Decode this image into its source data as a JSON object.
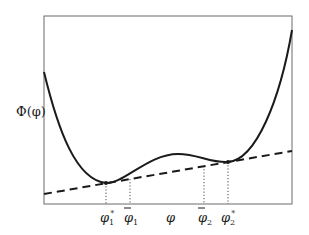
{
  "diagram": {
    "title": "",
    "y_axis_label": "Φ(φ)",
    "x_axis_label": "φ",
    "x_markers": [
      {
        "id": "phi1_star",
        "base": "φ",
        "sub": "1",
        "sup": "*",
        "bar": false
      },
      {
        "id": "phi1_bar",
        "base": "φ",
        "sub": "1",
        "sup": "",
        "bar": true
      },
      {
        "id": "phi",
        "base": "φ",
        "sub": "",
        "sup": "",
        "bar": false
      },
      {
        "id": "phi2_bar",
        "base": "φ",
        "sub": "2",
        "sup": "",
        "bar": true
      },
      {
        "id": "phi2_star",
        "base": "φ",
        "sub": "2",
        "sup": "*",
        "bar": false
      }
    ],
    "curve": "double-well free energy Φ(φ) with two minima",
    "tangent": "common tangent line (dashed) touching minima at φ1* and φ2*",
    "colors": {
      "curve": "#1a1a1a",
      "frame": "#555555",
      "tangent": "#1a1a1a"
    }
  }
}
